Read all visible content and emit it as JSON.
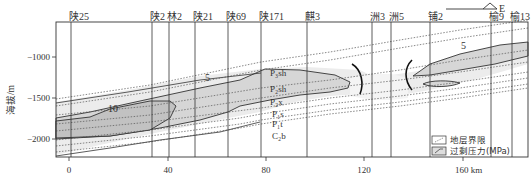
{
  "diagram": {
    "y_axis_label": "海拔/m",
    "y_ticks": [
      {
        "label": "−1000",
        "y": 57
      },
      {
        "label": "−1500",
        "y": 98
      },
      {
        "label": "−2000",
        "y": 139
      }
    ],
    "x_ticks": [
      {
        "label": "0",
        "x": 69
      },
      {
        "label": "40",
        "x": 168
      },
      {
        "label": "80",
        "x": 266
      },
      {
        "label": "120",
        "x": 364
      },
      {
        "label": "160 km",
        "x": 463
      }
    ],
    "direction_label": "E",
    "wells": [
      {
        "name": "陕25",
        "x": 71
      },
      {
        "name": "陕2",
        "x": 152
      },
      {
        "name": "林2",
        "x": 169
      },
      {
        "name": "陕21",
        "x": 195
      },
      {
        "name": "陕69",
        "x": 228
      },
      {
        "name": "陕171",
        "x": 261
      },
      {
        "name": "麒3",
        "x": 307
      },
      {
        "name": "洲3",
        "x": 372
      },
      {
        "name": "洲5",
        "x": 391
      },
      {
        "name": "铺2",
        "x": 430
      },
      {
        "name": "榆9",
        "x": 491
      },
      {
        "name": "榆13",
        "x": 512
      }
    ],
    "contour_labels": [
      {
        "label": "10",
        "x": 108,
        "y": 112
      },
      {
        "label": "5",
        "x": 205,
        "y": 81
      },
      {
        "label": "5",
        "x": 461,
        "y": 49
      }
    ],
    "strata": [
      {
        "label": "P₃sh",
        "x": 270,
        "y": 76
      },
      {
        "label": "P₂sh",
        "x": 270,
        "y": 92
      },
      {
        "label": "P₂x",
        "x": 270,
        "y": 105
      },
      {
        "label": "P₁s",
        "x": 272,
        "y": 117
      },
      {
        "label": "P₁t",
        "x": 272,
        "y": 127
      },
      {
        "label": "C₂b",
        "x": 272,
        "y": 139
      }
    ],
    "legend": [
      {
        "icon": "stratum-boundary-icon",
        "label": "地层界限"
      },
      {
        "icon": "overpressure-icon",
        "label": "过剩压力(MPa)"
      }
    ]
  }
}
